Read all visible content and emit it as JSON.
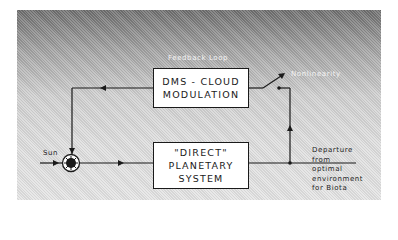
{
  "diagram": {
    "title_label": "Feedback Loop",
    "boxes": {
      "dms": {
        "line1": "DMS - CLOUD",
        "line2": "MODULATION"
      },
      "direct": {
        "line1": "\"DIRECT\"",
        "line2": "PLANETARY",
        "line3": "SYSTEM"
      }
    },
    "labels": {
      "sun": "Sun",
      "nonlinearity": "Nonlinearity",
      "departure": [
        "Departure",
        "from",
        "optimal",
        "environment",
        "for Biota"
      ]
    },
    "colors": {
      "line": "#1a1a1a",
      "box_fill": "#ffffff",
      "panel_top": "#6e6e6e",
      "panel_bottom": "#e4e4e4"
    },
    "nodes": [
      {
        "id": "sun-input",
        "type": "input"
      },
      {
        "id": "summing-junction",
        "type": "summation"
      },
      {
        "id": "direct-planetary-system",
        "type": "block"
      },
      {
        "id": "dms-cloud-modulation",
        "type": "block"
      },
      {
        "id": "nonlinearity-switch",
        "type": "switch"
      },
      {
        "id": "departure-output",
        "type": "output"
      }
    ],
    "edges": [
      {
        "from": "sun-input",
        "to": "summing-junction"
      },
      {
        "from": "summing-junction",
        "to": "direct-planetary-system"
      },
      {
        "from": "direct-planetary-system",
        "to": "departure-output"
      },
      {
        "from": "departure-output",
        "to": "nonlinearity-switch"
      },
      {
        "from": "nonlinearity-switch",
        "to": "dms-cloud-modulation"
      },
      {
        "from": "dms-cloud-modulation",
        "to": "summing-junction"
      }
    ]
  }
}
